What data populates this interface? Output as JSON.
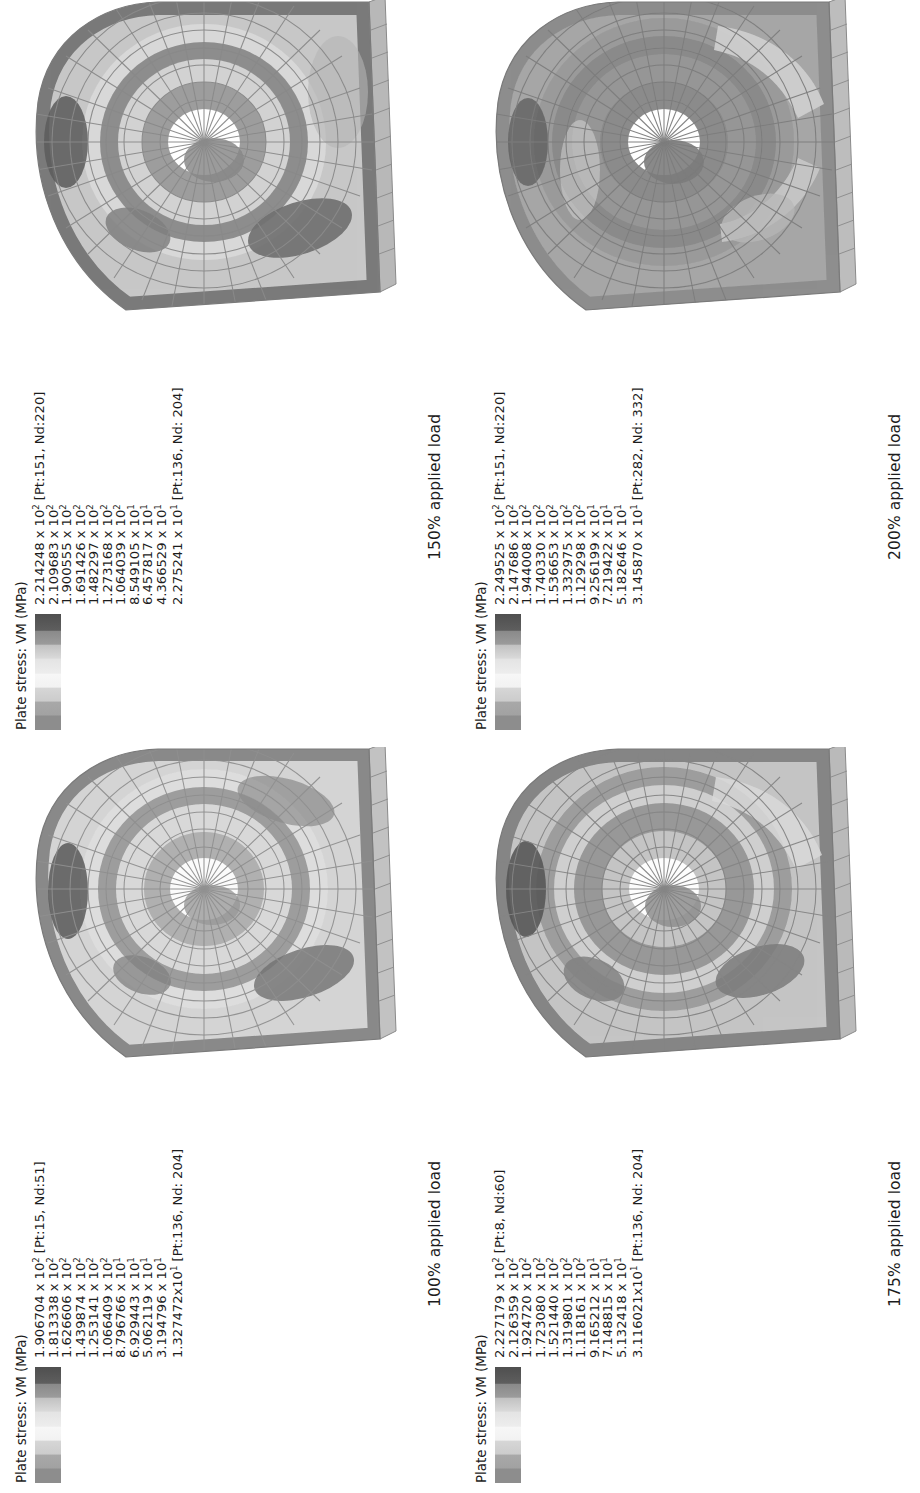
{
  "figure": {
    "kind": "finite-element plate stress contour plots",
    "panel_count": 4
  },
  "panels": [
    {
      "id": "panel-150",
      "caption": "150% applied load",
      "legend": {
        "title": "Plate stress: VM (MPa)",
        "max_label": "2.214248 x 10",
        "max_exp": "2",
        "max_note": " [Pt:151, Nd:220]",
        "ticks": [
          {
            "mantissa": "2.214248 x 10",
            "exp": "2",
            "note": " [Pt:151, Nd:220]"
          },
          {
            "mantissa": "2.109683 x 10",
            "exp": "2",
            "note": ""
          },
          {
            "mantissa": "1.900555 x 10",
            "exp": "2",
            "note": ""
          },
          {
            "mantissa": "1.691426 x 10",
            "exp": "2",
            "note": ""
          },
          {
            "mantissa": "1.482297 x 10",
            "exp": "2",
            "note": ""
          },
          {
            "mantissa": "1.273168 x 10",
            "exp": "2",
            "note": ""
          },
          {
            "mantissa": "1.064039 x 10",
            "exp": "2",
            "note": ""
          },
          {
            "mantissa": "8.549105 x 10",
            "exp": "1",
            "note": ""
          },
          {
            "mantissa": "6.457817 x 10",
            "exp": "1",
            "note": ""
          },
          {
            "mantissa": "4.366529 x 10",
            "exp": "1",
            "note": ""
          },
          {
            "mantissa": "2.275241 x 10",
            "exp": "1",
            "note": " [Pt:136, Nd: 204]"
          }
        ]
      }
    },
    {
      "id": "panel-200",
      "caption": "200% applied load",
      "legend": {
        "title": "Plate stress: VM (MPa)",
        "ticks": [
          {
            "mantissa": "2.249525 x 10",
            "exp": "2",
            "note": " [Pt:151, Nd:220]"
          },
          {
            "mantissa": "2.147686 x 10",
            "exp": "2",
            "note": ""
          },
          {
            "mantissa": "1.944008 x 10",
            "exp": "2",
            "note": ""
          },
          {
            "mantissa": "1.740330 x 10",
            "exp": "2",
            "note": ""
          },
          {
            "mantissa": "1.536653 x 10",
            "exp": "2",
            "note": ""
          },
          {
            "mantissa": "1.332975 x 10",
            "exp": "2",
            "note": ""
          },
          {
            "mantissa": "1.129298 x 10",
            "exp": "2",
            "note": ""
          },
          {
            "mantissa": "9.256199 x 10",
            "exp": "1",
            "note": ""
          },
          {
            "mantissa": "7.219422 x 10",
            "exp": "1",
            "note": ""
          },
          {
            "mantissa": "5.182646 x 10",
            "exp": "1",
            "note": ""
          },
          {
            "mantissa": "3.145870 x 10",
            "exp": "1",
            "note": " [Pt:282, Nd: 332]"
          }
        ]
      }
    },
    {
      "id": "panel-100",
      "caption": "100% applied load",
      "legend": {
        "title": "Plate stress: VM (MPa)",
        "ticks": [
          {
            "mantissa": "1.906704 x 10",
            "exp": "2",
            "note": " [Pt:15, Nd:51]"
          },
          {
            "mantissa": "1.813338 x 10",
            "exp": "2",
            "note": ""
          },
          {
            "mantissa": "1.626606 x 10",
            "exp": "2",
            "note": ""
          },
          {
            "mantissa": "1.439874 x 10",
            "exp": "2",
            "note": ""
          },
          {
            "mantissa": "1.253141 x 10",
            "exp": "2",
            "note": ""
          },
          {
            "mantissa": "1.066409 x 10",
            "exp": "2",
            "note": ""
          },
          {
            "mantissa": "8.796766 x 10",
            "exp": "1",
            "note": ""
          },
          {
            "mantissa": "6.929443 x 10",
            "exp": "1",
            "note": ""
          },
          {
            "mantissa": "5.062119 x 10",
            "exp": "1",
            "note": ""
          },
          {
            "mantissa": "3.194796 x 10",
            "exp": "1",
            "note": ""
          },
          {
            "mantissa": "1.327472x10",
            "exp": "1",
            "note": " [Pt:136, Nd: 204]"
          }
        ]
      }
    },
    {
      "id": "panel-175",
      "caption": "175% applied load",
      "legend": {
        "title": "Plate stress: VM (MPa)",
        "ticks": [
          {
            "mantissa": "2.227179 x 10",
            "exp": "2",
            "note": " [Pt:8, Nd:60]"
          },
          {
            "mantissa": "2.126359 x 10",
            "exp": "2",
            "note": ""
          },
          {
            "mantissa": "1.924720 x 10",
            "exp": "2",
            "note": ""
          },
          {
            "mantissa": "1.723080 x 10",
            "exp": "2",
            "note": ""
          },
          {
            "mantissa": "1.521440 x 10",
            "exp": "2",
            "note": ""
          },
          {
            "mantissa": "1.319801 x 10",
            "exp": "2",
            "note": ""
          },
          {
            "mantissa": "1.118161 x 10",
            "exp": "2",
            "note": ""
          },
          {
            "mantissa": "9.165212 x 10",
            "exp": "1",
            "note": ""
          },
          {
            "mantissa": "7.148815 x 10",
            "exp": "1",
            "note": ""
          },
          {
            "mantissa": "5.132418 x 10",
            "exp": "1",
            "note": ""
          },
          {
            "mantissa": "3.116021x10",
            "exp": "1",
            "note": " [Pt:136, Nd: 204]"
          }
        ]
      }
    }
  ],
  "chart_data": {
    "type": "heatmap",
    "colormap": "grayscale banded (11 levels)",
    "legend_position": "left of each panel, rotated 90deg",
    "grid": false,
    "series": [
      {
        "name": "150% applied load",
        "min": 22.75241,
        "max": 221.4248,
        "min_location": "Pt:136, Nd: 204",
        "max_location": "Pt:151, Nd:220",
        "levels": [
          221.4248,
          210.9683,
          190.0555,
          169.1426,
          148.2297,
          127.3168,
          106.4039,
          85.49105,
          64.57817,
          43.66529,
          22.75241
        ]
      },
      {
        "name": "200% applied load",
        "min": 31.4587,
        "max": 224.9525,
        "min_location": "Pt:282, Nd: 332",
        "max_location": "Pt:151, Nd:220",
        "levels": [
          224.9525,
          214.7686,
          194.4008,
          174.033,
          153.6653,
          133.2975,
          112.9298,
          92.56199,
          72.19422,
          51.82646,
          31.4587
        ]
      },
      {
        "name": "100% applied load",
        "min": 13.27472,
        "max": 190.6704,
        "min_location": "Pt:136, Nd: 204",
        "max_location": "Pt:15, Nd:51",
        "levels": [
          190.6704,
          181.3338,
          162.6606,
          143.9874,
          125.3141,
          106.6409,
          87.96766,
          69.29443,
          50.62119,
          31.94796,
          13.27472
        ]
      },
      {
        "name": "175% applied load",
        "min": 31.16021,
        "max": 222.7179,
        "min_location": "Pt:136, Nd: 204",
        "max_location": "Pt:8, Nd:60",
        "levels": [
          222.7179,
          212.6359,
          192.472,
          172.308,
          152.144,
          131.9801,
          111.8161,
          91.65212,
          71.48815,
          51.32418,
          31.16021
        ]
      }
    ],
    "units": "MPa",
    "quantity": "von Mises plate stress"
  }
}
